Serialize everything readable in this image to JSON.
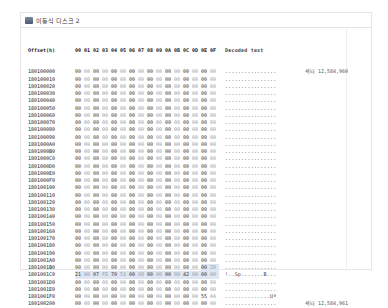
{
  "window": {
    "title": "이동식 디스크 2"
  },
  "header": {
    "offset_label": "Offset(h)",
    "columns": [
      "00",
      "01",
      "02",
      "03",
      "04",
      "05",
      "06",
      "07",
      "08",
      "09",
      "0A",
      "0B",
      "0C",
      "0D",
      "0E",
      "0F"
    ],
    "decoded_label": "Decoded text"
  },
  "rows": [
    {
      "offset": "180100000",
      "bytes": [
        "00",
        "00",
        "00",
        "00",
        "00",
        "00",
        "00",
        "00",
        "00",
        "00",
        "00",
        "00",
        "00",
        "00",
        "00",
        "00"
      ],
      "text": "................"
    },
    {
      "offset": "180100010",
      "bytes": [
        "00",
        "00",
        "00",
        "00",
        "00",
        "00",
        "00",
        "00",
        "00",
        "00",
        "00",
        "00",
        "00",
        "00",
        "00",
        "00"
      ],
      "text": "................"
    },
    {
      "offset": "180100020",
      "bytes": [
        "00",
        "00",
        "00",
        "00",
        "00",
        "00",
        "00",
        "00",
        "00",
        "00",
        "00",
        "00",
        "00",
        "00",
        "00",
        "00"
      ],
      "text": "................"
    },
    {
      "offset": "180100030",
      "bytes": [
        "00",
        "00",
        "00",
        "00",
        "00",
        "00",
        "00",
        "00",
        "00",
        "00",
        "00",
        "00",
        "00",
        "00",
        "00",
        "00"
      ],
      "text": "................"
    },
    {
      "offset": "180100040",
      "bytes": [
        "00",
        "00",
        "00",
        "00",
        "00",
        "00",
        "00",
        "00",
        "00",
        "00",
        "00",
        "00",
        "00",
        "00",
        "00",
        "00"
      ],
      "text": "................"
    },
    {
      "offset": "180100050",
      "bytes": [
        "00",
        "00",
        "00",
        "00",
        "00",
        "00",
        "00",
        "00",
        "00",
        "00",
        "00",
        "00",
        "00",
        "00",
        "00",
        "00"
      ],
      "text": "................"
    },
    {
      "offset": "180100060",
      "bytes": [
        "00",
        "00",
        "00",
        "00",
        "00",
        "00",
        "00",
        "00",
        "00",
        "00",
        "00",
        "00",
        "00",
        "00",
        "00",
        "00"
      ],
      "text": "................"
    },
    {
      "offset": "180100070",
      "bytes": [
        "00",
        "00",
        "00",
        "00",
        "00",
        "00",
        "00",
        "00",
        "00",
        "00",
        "00",
        "00",
        "00",
        "00",
        "00",
        "00"
      ],
      "text": "................"
    },
    {
      "offset": "180100080",
      "bytes": [
        "00",
        "00",
        "00",
        "00",
        "00",
        "00",
        "00",
        "00",
        "00",
        "00",
        "00",
        "00",
        "00",
        "00",
        "00",
        "00"
      ],
      "text": "................"
    },
    {
      "offset": "180100090",
      "bytes": [
        "00",
        "00",
        "00",
        "00",
        "00",
        "00",
        "00",
        "00",
        "00",
        "00",
        "00",
        "00",
        "00",
        "00",
        "00",
        "00"
      ],
      "text": "................"
    },
    {
      "offset": "1801000A0",
      "bytes": [
        "00",
        "00",
        "00",
        "00",
        "00",
        "00",
        "00",
        "00",
        "00",
        "00",
        "00",
        "00",
        "00",
        "00",
        "00",
        "00"
      ],
      "text": "................"
    },
    {
      "offset": "1801000B0",
      "bytes": [
        "00",
        "00",
        "00",
        "00",
        "00",
        "00",
        "00",
        "00",
        "00",
        "00",
        "00",
        "00",
        "00",
        "00",
        "00",
        "00"
      ],
      "text": "................"
    },
    {
      "offset": "1801000C0",
      "bytes": [
        "00",
        "00",
        "00",
        "00",
        "00",
        "00",
        "00",
        "00",
        "00",
        "00",
        "00",
        "00",
        "00",
        "00",
        "00",
        "00"
      ],
      "text": "................"
    },
    {
      "offset": "1801000D0",
      "bytes": [
        "00",
        "00",
        "00",
        "00",
        "00",
        "00",
        "00",
        "00",
        "00",
        "00",
        "00",
        "00",
        "00",
        "00",
        "00",
        "00"
      ],
      "text": "................"
    },
    {
      "offset": "1801000E0",
      "bytes": [
        "00",
        "00",
        "00",
        "00",
        "00",
        "00",
        "00",
        "00",
        "00",
        "00",
        "00",
        "00",
        "00",
        "00",
        "00",
        "00"
      ],
      "text": "................"
    },
    {
      "offset": "1801000F0",
      "bytes": [
        "00",
        "00",
        "00",
        "00",
        "00",
        "00",
        "00",
        "00",
        "00",
        "00",
        "00",
        "00",
        "00",
        "00",
        "00",
        "00"
      ],
      "text": "................"
    },
    {
      "offset": "180100100",
      "bytes": [
        "00",
        "00",
        "00",
        "00",
        "00",
        "00",
        "00",
        "00",
        "00",
        "00",
        "00",
        "00",
        "00",
        "00",
        "00",
        "00"
      ],
      "text": "................"
    },
    {
      "offset": "180100110",
      "bytes": [
        "00",
        "00",
        "00",
        "00",
        "00",
        "00",
        "00",
        "00",
        "00",
        "00",
        "00",
        "00",
        "00",
        "00",
        "00",
        "00"
      ],
      "text": "................"
    },
    {
      "offset": "180100120",
      "bytes": [
        "00",
        "00",
        "00",
        "00",
        "00",
        "00",
        "00",
        "00",
        "00",
        "00",
        "00",
        "00",
        "00",
        "00",
        "00",
        "00"
      ],
      "text": "................"
    },
    {
      "offset": "180100130",
      "bytes": [
        "00",
        "00",
        "00",
        "00",
        "00",
        "00",
        "00",
        "00",
        "00",
        "00",
        "00",
        "00",
        "00",
        "00",
        "00",
        "00"
      ],
      "text": "................"
    },
    {
      "offset": "180100140",
      "bytes": [
        "00",
        "00",
        "00",
        "00",
        "00",
        "00",
        "00",
        "00",
        "00",
        "00",
        "00",
        "00",
        "00",
        "00",
        "00",
        "00"
      ],
      "text": "................"
    },
    {
      "offset": "180100150",
      "bytes": [
        "00",
        "00",
        "00",
        "00",
        "00",
        "00",
        "00",
        "00",
        "00",
        "00",
        "00",
        "00",
        "00",
        "00",
        "00",
        "00"
      ],
      "text": "................"
    },
    {
      "offset": "180100160",
      "bytes": [
        "00",
        "00",
        "00",
        "00",
        "00",
        "00",
        "00",
        "00",
        "00",
        "00",
        "00",
        "00",
        "00",
        "00",
        "00",
        "00"
      ],
      "text": "................"
    },
    {
      "offset": "180100170",
      "bytes": [
        "00",
        "00",
        "00",
        "00",
        "00",
        "00",
        "00",
        "00",
        "00",
        "00",
        "00",
        "00",
        "00",
        "00",
        "00",
        "00"
      ],
      "text": "................"
    },
    {
      "offset": "180100180",
      "bytes": [
        "00",
        "00",
        "00",
        "00",
        "00",
        "00",
        "00",
        "00",
        "00",
        "00",
        "00",
        "00",
        "00",
        "00",
        "00",
        "00"
      ],
      "text": "................"
    },
    {
      "offset": "180100190",
      "bytes": [
        "00",
        "00",
        "00",
        "00",
        "00",
        "00",
        "00",
        "00",
        "00",
        "00",
        "00",
        "00",
        "00",
        "00",
        "00",
        "00"
      ],
      "text": "................"
    },
    {
      "offset": "1801001A0",
      "bytes": [
        "00",
        "00",
        "00",
        "00",
        "00",
        "00",
        "00",
        "00",
        "00",
        "00",
        "00",
        "00",
        "00",
        "00",
        "00",
        "00"
      ],
      "text": "................"
    },
    {
      "offset": "1801001B0",
      "bytes": [
        "00",
        "00",
        "00",
        "00",
        "00",
        "00",
        "00",
        "00",
        "00",
        "00",
        "00",
        "00",
        "00",
        "00",
        "00",
        "20"
      ],
      "text": "................"
    },
    {
      "offset": "1801001C0",
      "bytes": [
        "21",
        "00",
        "07",
        "FE",
        "70",
        "53",
        "00",
        "08",
        "00",
        "00",
        "00",
        "00",
        "42",
        "00",
        "00",
        "00"
      ],
      "text": "!..Sp.......B..."
    },
    {
      "offset": "1801001D0",
      "bytes": [
        "00",
        "00",
        "00",
        "00",
        "00",
        "00",
        "00",
        "00",
        "00",
        "00",
        "00",
        "00",
        "00",
        "00",
        "00",
        "00"
      ],
      "text": "................"
    },
    {
      "offset": "1801001E0",
      "bytes": [
        "00",
        "00",
        "00",
        "00",
        "00",
        "00",
        "00",
        "00",
        "00",
        "00",
        "00",
        "00",
        "00",
        "00",
        "00",
        "00"
      ],
      "text": "................"
    },
    {
      "offset": "1801001F0",
      "bytes": [
        "00",
        "00",
        "00",
        "00",
        "00",
        "00",
        "00",
        "00",
        "00",
        "00",
        "00",
        "00",
        "00",
        "00",
        "55",
        "AA"
      ],
      "text": "..............Uª"
    },
    {
      "offset": "180100200",
      "bytes": [
        "00",
        "00",
        "00",
        "00",
        "00",
        "00",
        "00",
        "00",
        "00",
        "00",
        "00",
        "00",
        "00",
        "00",
        "00",
        "00"
      ],
      "text": "................"
    }
  ],
  "selection": {
    "start_row": 27,
    "start_col": 14,
    "end_row": 28,
    "end_col": 15
  },
  "sector_markers": [
    {
      "row": 0,
      "label": "섹터 12,584,960"
    },
    {
      "row": 32,
      "label": "섹터 12,584,961"
    }
  ],
  "colors": {
    "selection": "#dde6f2",
    "border": "#e6e6e6"
  }
}
